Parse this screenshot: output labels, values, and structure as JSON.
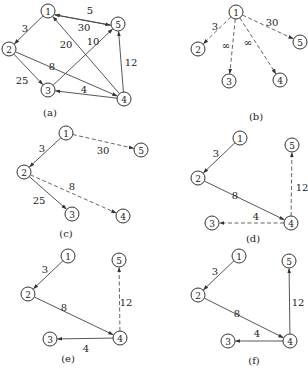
{
  "figure": {
    "node_radius": 7,
    "colors": {
      "stroke": "#333333",
      "background": "#ffffff",
      "text": "#222222"
    },
    "panels": [
      {
        "id": "a",
        "caption": "(a)",
        "caption_pos": [
          50,
          112
        ],
        "nodes": [
          {
            "id": "1",
            "label": "1",
            "x": 48,
            "y": 11
          },
          {
            "id": "2",
            "label": "2",
            "x": 9,
            "y": 49
          },
          {
            "id": "3",
            "label": "3",
            "x": 48,
            "y": 90
          },
          {
            "id": "4",
            "label": "4",
            "x": 124,
            "y": 99
          },
          {
            "id": "5",
            "label": "5",
            "x": 118,
            "y": 24
          }
        ],
        "edges": [
          {
            "from": "1",
            "to": "2",
            "weight": "3",
            "style": "solid",
            "label_pos": [
              25,
              28
            ]
          },
          {
            "from": "5",
            "to": "1",
            "weight": "5",
            "style": "solid",
            "label_pos": [
              90,
              10
            ],
            "offset": -2.5
          },
          {
            "from": "1",
            "to": "5",
            "weight": "30",
            "style": "solid",
            "label_pos": [
              84,
              27
            ],
            "offset": 2.5
          },
          {
            "from": "2",
            "to": "3",
            "weight": "25",
            "style": "solid",
            "label_pos": [
              22,
              80
            ]
          },
          {
            "from": "2",
            "to": "4",
            "weight": "8",
            "style": "solid",
            "label_pos": [
              52,
              66
            ]
          },
          {
            "from": "3",
            "to": "5",
            "weight": "10",
            "style": "solid",
            "label_pos": [
              93,
              41
            ]
          },
          {
            "from": "4",
            "to": "1",
            "weight": "20",
            "style": "solid",
            "label_pos": [
              66,
              44
            ]
          },
          {
            "from": "4",
            "to": "3",
            "weight": "4",
            "style": "solid",
            "label_pos": [
              84,
              89
            ]
          },
          {
            "from": "4",
            "to": "5",
            "weight": "12",
            "style": "solid",
            "label_pos": [
              131,
              62
            ]
          }
        ]
      },
      {
        "id": "b",
        "caption": "(b)",
        "caption_pos": [
          256,
          116
        ],
        "nodes": [
          {
            "id": "1",
            "label": "1",
            "x": 236,
            "y": 12
          },
          {
            "id": "2",
            "label": "2",
            "x": 198,
            "y": 49
          },
          {
            "id": "3",
            "label": "3",
            "x": 229,
            "y": 81
          },
          {
            "id": "4",
            "label": "4",
            "x": 280,
            "y": 80
          },
          {
            "id": "5",
            "label": "5",
            "x": 300,
            "y": 42
          }
        ],
        "edges": [
          {
            "from": "1",
            "to": "2",
            "weight": "3",
            "style": "dashed",
            "label_pos": [
              215,
              26
            ]
          },
          {
            "from": "1",
            "to": "3",
            "weight": "∞",
            "style": "dashed",
            "label_pos": [
              226,
              45
            ]
          },
          {
            "from": "1",
            "to": "4",
            "weight": "∞",
            "style": "dashed",
            "label_pos": [
              248,
              42
            ]
          },
          {
            "from": "1",
            "to": "5",
            "weight": "30",
            "style": "dashed",
            "label_pos": [
              272,
              22
            ]
          }
        ]
      },
      {
        "id": "c",
        "caption": "(c)",
        "caption_pos": [
          66,
          233
        ],
        "nodes": [
          {
            "id": "1",
            "label": "1",
            "x": 66,
            "y": 133
          },
          {
            "id": "2",
            "label": "2",
            "x": 24,
            "y": 172
          },
          {
            "id": "3",
            "label": "3",
            "x": 72,
            "y": 214
          },
          {
            "id": "4",
            "label": "4",
            "x": 123,
            "y": 216
          },
          {
            "id": "5",
            "label": "5",
            "x": 141,
            "y": 150
          }
        ],
        "edges": [
          {
            "from": "1",
            "to": "2",
            "weight": "3",
            "style": "solid",
            "label_pos": [
              42,
              148
            ]
          },
          {
            "from": "1",
            "to": "5",
            "weight": "30",
            "style": "dashed",
            "label_pos": [
              103,
              150
            ]
          },
          {
            "from": "2",
            "to": "3",
            "weight": "25",
            "style": "solid",
            "label_pos": [
              39,
              200
            ]
          },
          {
            "from": "2",
            "to": "4",
            "weight": "8",
            "style": "dashed",
            "label_pos": [
              72,
              186
            ]
          }
        ]
      },
      {
        "id": "d",
        "caption": "(d)",
        "caption_pos": [
          253,
          238
        ],
        "nodes": [
          {
            "id": "1",
            "label": "1",
            "x": 240,
            "y": 138
          },
          {
            "id": "2",
            "label": "2",
            "x": 198,
            "y": 178
          },
          {
            "id": "3",
            "label": "3",
            "x": 212,
            "y": 223
          },
          {
            "id": "4",
            "label": "4",
            "x": 291,
            "y": 223
          },
          {
            "id": "5",
            "label": "5",
            "x": 292,
            "y": 145
          }
        ],
        "edges": [
          {
            "from": "1",
            "to": "2",
            "weight": "3",
            "style": "solid",
            "label_pos": [
              216,
              153
            ]
          },
          {
            "from": "2",
            "to": "4",
            "weight": "8",
            "style": "solid",
            "label_pos": [
              235,
              195
            ]
          },
          {
            "from": "4",
            "to": "5",
            "weight": "12",
            "style": "dashed",
            "label_pos": [
              302,
              187
            ]
          },
          {
            "from": "4",
            "to": "3",
            "weight": "4",
            "style": "dashed",
            "label_pos": [
              256,
              216
            ]
          }
        ]
      },
      {
        "id": "e",
        "caption": "(e)",
        "caption_pos": [
          68,
          358
        ],
        "nodes": [
          {
            "id": "1",
            "label": "1",
            "x": 68,
            "y": 256
          },
          {
            "id": "2",
            "label": "2",
            "x": 28,
            "y": 294
          },
          {
            "id": "3",
            "label": "3",
            "x": 50,
            "y": 339
          },
          {
            "id": "4",
            "label": "4",
            "x": 120,
            "y": 338
          },
          {
            "id": "5",
            "label": "5",
            "x": 119,
            "y": 260
          }
        ],
        "edges": [
          {
            "from": "1",
            "to": "2",
            "weight": "3",
            "style": "solid",
            "label_pos": [
              45,
              269
            ]
          },
          {
            "from": "2",
            "to": "4",
            "weight": "8",
            "style": "solid",
            "label_pos": [
              64,
              307
            ]
          },
          {
            "from": "4",
            "to": "5",
            "weight": "12",
            "style": "dashed",
            "label_pos": [
              126,
              302
            ]
          },
          {
            "from": "4",
            "to": "3",
            "weight": "4",
            "style": "solid",
            "label_pos": [
              86,
              348
            ]
          }
        ]
      },
      {
        "id": "f",
        "caption": "(f)",
        "caption_pos": [
          254,
          360
        ],
        "nodes": [
          {
            "id": "1",
            "label": "1",
            "x": 239,
            "y": 256
          },
          {
            "id": "2",
            "label": "2",
            "x": 198,
            "y": 295
          },
          {
            "id": "3",
            "label": "3",
            "x": 228,
            "y": 341
          },
          {
            "id": "4",
            "label": "4",
            "x": 290,
            "y": 341
          },
          {
            "id": "5",
            "label": "5",
            "x": 289,
            "y": 261
          }
        ],
        "edges": [
          {
            "from": "1",
            "to": "2",
            "weight": "3",
            "style": "solid",
            "label_pos": [
              215,
              271
            ]
          },
          {
            "from": "2",
            "to": "4",
            "weight": "8",
            "style": "solid",
            "label_pos": [
              237,
              313
            ]
          },
          {
            "from": "4",
            "to": "5",
            "weight": "12",
            "style": "solid",
            "label_pos": [
              298,
              302
            ]
          },
          {
            "from": "4",
            "to": "3",
            "weight": "4",
            "style": "solid",
            "label_pos": [
              257,
              333
            ]
          }
        ]
      }
    ]
  }
}
